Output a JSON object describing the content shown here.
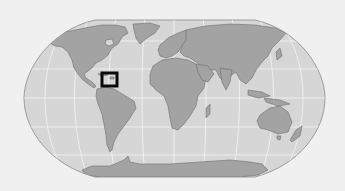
{
  "map": {
    "projection": "robinson",
    "type": "world-locator",
    "colors": {
      "background": "#f0f0f0",
      "ocean": "#d6d6d6",
      "land": "#a3a3a3",
      "border": "#6e6e6e",
      "graticule": "#f4f4f4",
      "highlight": "#0a0a0a"
    },
    "highlight": {
      "region": "Caribbean",
      "box": {
        "x": 102,
        "y": 73,
        "width": 15,
        "height": 13
      }
    }
  }
}
